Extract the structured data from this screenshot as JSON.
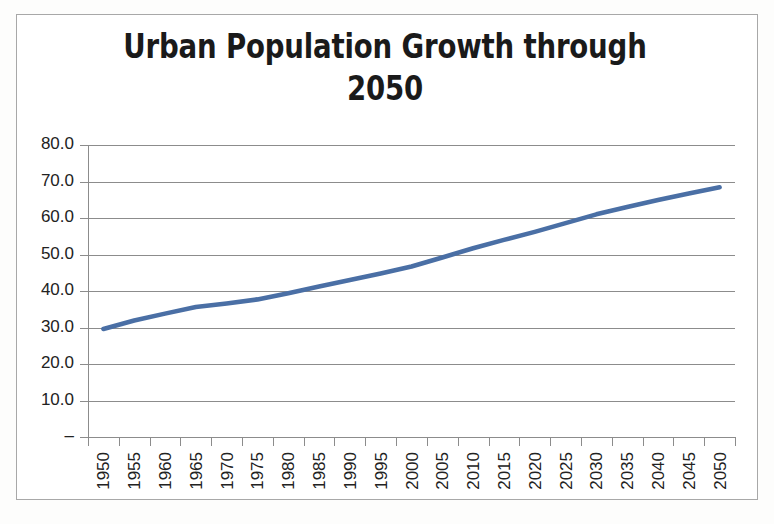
{
  "chart": {
    "title": "Urban Population Growth through 2050",
    "title_line1": "Urban Population Growth through",
    "title_line2": "2050",
    "series_color": "#4a6fa5",
    "gridline_color": "#8c8c8c",
    "frame_color": "#a8a8a8",
    "background_color": "#ffffff",
    "axis_text_color": "#222222"
  },
  "axes": {
    "y_tick_labels": [
      "80.0",
      "70.0",
      "60.0",
      "50.0",
      "40.0",
      "30.0",
      "20.0",
      "10.0",
      "–"
    ],
    "y_tick_values": [
      80,
      70,
      60,
      50,
      40,
      30,
      20,
      10,
      0
    ],
    "x_tick_labels": [
      "1950",
      "1955",
      "1960",
      "1965",
      "1970",
      "1975",
      "1980",
      "1985",
      "1990",
      "1995",
      "2000",
      "2005",
      "2010",
      "2015",
      "2020",
      "2025",
      "2030",
      "2035",
      "2040",
      "2045",
      "2050"
    ]
  },
  "chart_data": {
    "type": "line",
    "title": "Urban Population Growth through 2050",
    "xlabel": "",
    "ylabel": "",
    "ylim": [
      0,
      80
    ],
    "ytick_interval": 10,
    "grid": true,
    "legend": "none",
    "categories": [
      "1950",
      "1955",
      "1960",
      "1965",
      "1970",
      "1975",
      "1980",
      "1985",
      "1990",
      "1995",
      "2000",
      "2005",
      "2010",
      "2015",
      "2020",
      "2025",
      "2030",
      "2035",
      "2040",
      "2045",
      "2050"
    ],
    "series": [
      {
        "name": "Urban population (% of total)",
        "color": "#4a6fa5",
        "values": [
          29.6,
          31.9,
          33.8,
          35.6,
          36.6,
          37.7,
          39.4,
          41.2,
          43.0,
          44.8,
          46.7,
          49.2,
          51.7,
          54.0,
          56.2,
          58.6,
          61.0,
          63.0,
          64.9,
          66.7,
          68.4
        ]
      }
    ]
  }
}
